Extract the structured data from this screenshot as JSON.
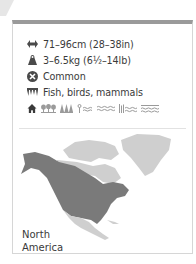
{
  "facts": {
    "length": {
      "icon": "length-arrows-icon",
      "text": "71–96cm (28–38in)"
    },
    "weight": {
      "icon": "weight-icon",
      "text": "3–6.5kg (6½–14lb)"
    },
    "status": {
      "icon": "conservation-status-icon",
      "text": "Common"
    },
    "diet": {
      "icon": "diet-teeth-icon",
      "text": "Fish, birds, mammals"
    },
    "habitats": {
      "icons": [
        "house-icon",
        "deciduous-forest-icon",
        "coniferous-forest-icon",
        "wetland-icon",
        "river-icon",
        "marsh-icon",
        "lake-icon"
      ]
    }
  },
  "map": {
    "region_label_line1": "North",
    "region_label_line2": "America",
    "range_color": "#7a7a7a",
    "land_color": "#cfcfcf"
  },
  "colors": {
    "top_bar": "#9a9a9a",
    "border": "#d6d6d6",
    "icon": "#4a4a4a"
  }
}
